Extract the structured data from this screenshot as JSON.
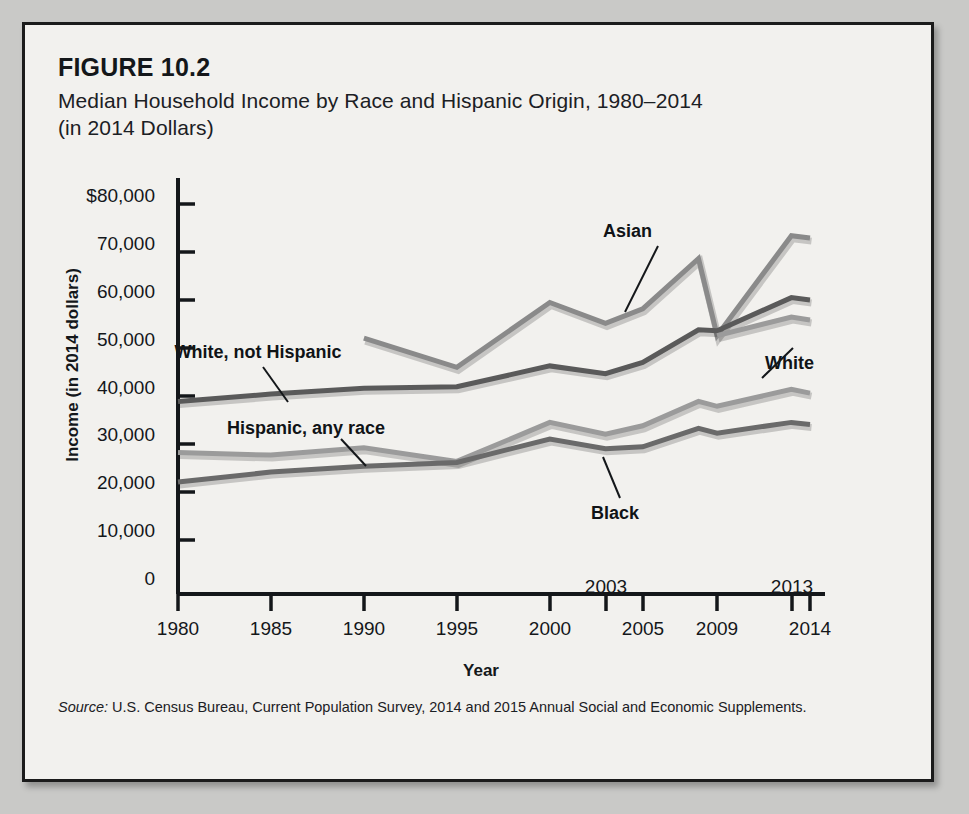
{
  "figure": {
    "number": "FIGURE 10.2",
    "title_line1": "Median Household Income by Race and Hispanic Origin, 1980–2014",
    "title_line2": "(in 2014 Dollars)",
    "source_prefix": "Source:",
    "source_text": " U.S. Census Bureau, Current Population Survey, 2014 and 2015 Annual Social and Economic Supplements."
  },
  "chart_data": {
    "type": "line",
    "title": "Median Household Income by Race and Hispanic Origin, 1980–2014 (in 2014 Dollars)",
    "xlabel": "Year",
    "ylabel": "Income (in 2014 dollars)",
    "xlim": [
      1980,
      2014
    ],
    "ylim": [
      0,
      80000
    ],
    "grid": false,
    "legend": "inline-annotations",
    "ytick_labels": [
      "$80,000",
      "70,000",
      "60,000",
      "50,000",
      "40,000",
      "30,000",
      "20,000",
      "10,000",
      "0"
    ],
    "ytick_values": [
      80000,
      70000,
      60000,
      50000,
      40000,
      30000,
      20000,
      10000,
      0
    ],
    "xtick_labels": [
      "1980",
      "1985",
      "1990",
      "1995",
      "2000",
      "2005",
      "2009",
      "2014"
    ],
    "xtick_values": [
      1980,
      1985,
      1990,
      1995,
      2000,
      2005,
      2009,
      2014
    ],
    "xtick_labels_raised": [
      "2003",
      "2013"
    ],
    "xtick_values_raised": [
      2003,
      2013
    ],
    "series": [
      {
        "name": "Asian",
        "color": "#8a8a8a",
        "x": [
          1990,
          1995,
          2000,
          2003,
          2005,
          2008,
          2009,
          2013,
          2014
        ],
        "values": [
          52500,
          46500,
          59800,
          55500,
          58500,
          68800,
          53000,
          73500,
          73000
        ]
      },
      {
        "name": "White, not Hispanic",
        "color": "#5a5a5a",
        "x": [
          1980,
          1985,
          1990,
          1995,
          2000,
          2003,
          2005,
          2008,
          2009,
          2013,
          2014
        ],
        "values": [
          39500,
          41000,
          42200,
          42500,
          46800,
          45200,
          47500,
          54200,
          54000,
          60800,
          60300
        ]
      },
      {
        "name": "White",
        "color": "#9b9b9b",
        "x": [
          2009,
          2013,
          2014
        ],
        "values": [
          53000,
          56800,
          56200
        ]
      },
      {
        "name": "Hispanic, any race",
        "color": "#9b9b9b",
        "x": [
          1980,
          1985,
          1990,
          1995,
          2000,
          2003,
          2005,
          2008,
          2009,
          2013,
          2014
        ],
        "values": [
          29000,
          28500,
          30000,
          27200,
          35200,
          32800,
          34500,
          39500,
          38500,
          42000,
          41200
        ]
      },
      {
        "name": "Black",
        "color": "#6a6a6a",
        "x": [
          1980,
          1985,
          1990,
          1995,
          2000,
          2003,
          2005,
          2008,
          2009,
          2013,
          2014
        ],
        "values": [
          23000,
          25000,
          26200,
          27000,
          31800,
          29800,
          30200,
          34000,
          33000,
          35200,
          34800
        ]
      }
    ],
    "annotations": [
      {
        "label": "Asian",
        "x": 2004,
        "y": 77000
      },
      {
        "label": "White, not Hispanic",
        "x": 1984,
        "y": 51000
      },
      {
        "label": "White",
        "x": 2011,
        "y": 50000
      },
      {
        "label": "Hispanic, any race",
        "x": 1990,
        "y": 36500
      },
      {
        "label": "Black",
        "x": 2004,
        "y": 22000
      }
    ]
  }
}
